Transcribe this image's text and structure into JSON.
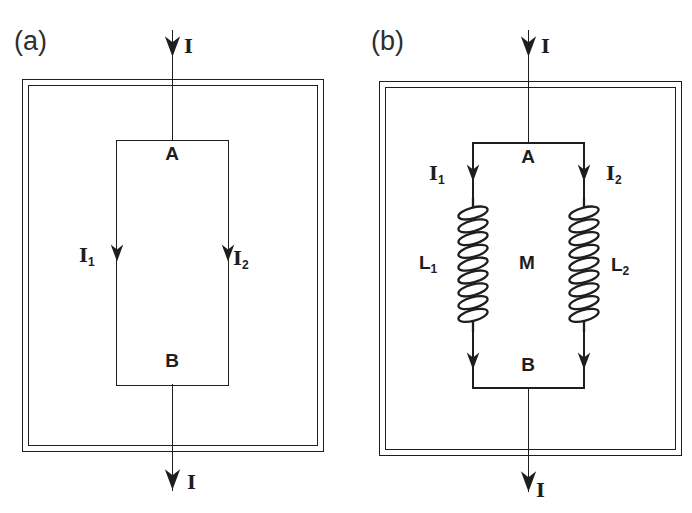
{
  "colors": {
    "ink": "#1e1e1e",
    "background": "#ffffff"
  },
  "figure_a": {
    "panel_label": "(a)",
    "top_current": "I",
    "bottom_current": "I",
    "node_a": "A",
    "node_b": "B",
    "left_branch_current": {
      "base": "I",
      "sub": "1"
    },
    "right_branch_current": {
      "base": "I",
      "sub": "2"
    }
  },
  "figure_b": {
    "panel_label": "(b)",
    "top_current": "I",
    "bottom_current": "I",
    "node_a": "A",
    "node_b": "B",
    "left_branch_current": {
      "base": "I",
      "sub": "1"
    },
    "right_branch_current": {
      "base": "I",
      "sub": "2"
    },
    "left_inductor": {
      "base": "L",
      "sub": "1"
    },
    "right_inductor": {
      "base": "L",
      "sub": "2"
    },
    "mutual_inductance": "M"
  }
}
